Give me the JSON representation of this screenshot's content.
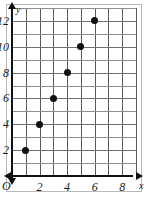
{
  "figure": {
    "origin_label": "O",
    "x_axis_name": "x",
    "y_axis_name": "y"
  },
  "chart_data": {
    "type": "scatter",
    "title": "",
    "subtitle": "",
    "xlabel": "x",
    "ylabel": "y",
    "x": [
      1,
      2,
      3,
      4,
      5,
      6
    ],
    "values": [
      2,
      4,
      6,
      8,
      10,
      12
    ],
    "points": [
      {
        "x": 1,
        "y": 2
      },
      {
        "x": 2,
        "y": 4
      },
      {
        "x": 3,
        "y": 6
      },
      {
        "x": 4,
        "y": 8
      },
      {
        "x": 5,
        "y": 10
      },
      {
        "x": 6,
        "y": 12
      }
    ],
    "xlim": [
      0,
      9
    ],
    "ylim": [
      0,
      13
    ],
    "x_ticks": [
      2,
      4,
      6,
      8
    ],
    "x_tick_labels": [
      "2",
      "4",
      "6",
      "8"
    ],
    "y_ticks": [
      2,
      4,
      6,
      8,
      10,
      12
    ],
    "y_tick_labels": [
      "2",
      "4",
      "6",
      "8",
      "10",
      "12"
    ],
    "x_gridlines": [
      1,
      2,
      3,
      4,
      5,
      6,
      7,
      8,
      9
    ],
    "y_gridlines": [
      1,
      2,
      3,
      4,
      5,
      6,
      7,
      8,
      9,
      10,
      11,
      12,
      13
    ],
    "grid": true,
    "legend": null,
    "marker_color": "#111111",
    "grid_color": "#8d8d8d",
    "axis_color": "#111111"
  }
}
